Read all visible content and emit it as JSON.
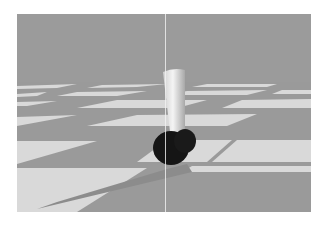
{
  "scene": {
    "description": "3D simulation render: a white capsule body balancing on a dark spherical wheel over a checkerboard floor",
    "colors": {
      "sky": "#9b9b9b",
      "tile_light": "#d9d9d9",
      "tile_dark": "#9a9a9a",
      "shadow": "#8a8a8a",
      "capsule": "#efefef",
      "wheel": "#151515",
      "guide_line": "#f2f2f2"
    },
    "objects": [
      "floor",
      "capsule-body",
      "wheel",
      "shadow",
      "vertical-guide-line"
    ]
  }
}
